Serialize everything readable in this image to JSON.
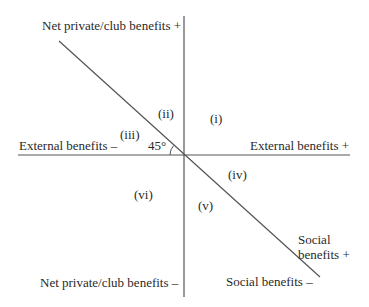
{
  "diagram": {
    "axes": {
      "vertical_top": "Net private/club benefits +",
      "vertical_bottom": "Net private/club benefits –",
      "horizontal_left": "External benefits –",
      "horizontal_right": "External benefits +",
      "diagonal_top_line1": "Social",
      "diagonal_top_line2": "benefits +",
      "diagonal_bottom": "Social benefits –"
    },
    "angle_label": "45°",
    "regions": {
      "i": "(i)",
      "ii": "(ii)",
      "iii": "(iii)",
      "iv": "(iv)",
      "v": "(v)",
      "vi": "(vi)"
    },
    "colors": {
      "line": "#555555",
      "text": "#2a2a2a",
      "background": "#ffffff"
    }
  }
}
